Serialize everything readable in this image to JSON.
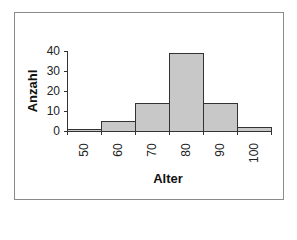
{
  "chart_data": {
    "type": "bar",
    "title": "",
    "xlabel": "Alter",
    "ylabel": "Anzahl",
    "categories": [
      "50",
      "60",
      "70",
      "80",
      "90",
      "100"
    ],
    "values": [
      1,
      5,
      14,
      39,
      14,
      2
    ],
    "ylim": [
      0,
      40
    ],
    "yticks": [
      "0",
      "10",
      "20",
      "30",
      "40"
    ],
    "grid": false,
    "legend": "none",
    "bar_fill": "#c8c8c8",
    "bar_border": "#333333"
  }
}
